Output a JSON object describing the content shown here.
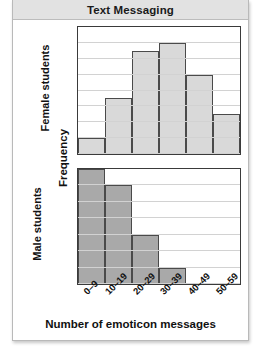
{
  "title": "Text Messaging",
  "axis": {
    "ylabel": "Frequency",
    "xlabel": "Number of emoticon messages"
  },
  "panels": {
    "female": {
      "label": "Female students",
      "yticks": [
        "0",
        "2",
        "4",
        "6",
        "8",
        "10",
        "12",
        "14",
        "16"
      ]
    },
    "male": {
      "label": "Male students",
      "yticks": [
        "0",
        "2",
        "4",
        "6",
        "8",
        "10",
        "12",
        "14"
      ]
    }
  },
  "colors": {
    "female_bar": "#d9d9d9",
    "male_bar": "#a9a9a9",
    "bar_outline": "#4a4a4a",
    "gridline": "#d2d2d2",
    "title_band": "#e2e2e2",
    "frame": "#b9b9b9"
  },
  "chart_data": {
    "type": "bar",
    "title": "Text Messaging",
    "xlabel": "Number of emoticon messages",
    "ylabel": "Frequency",
    "grid": true,
    "legend": "none",
    "categories": [
      "0–9",
      "10–19",
      "20–29",
      "30–39",
      "40–49",
      "50–59"
    ],
    "panels": [
      {
        "name": "Female students",
        "values": [
          2,
          7,
          13,
          14,
          10,
          5
        ],
        "ylim": [
          0,
          16
        ],
        "ytick_step": 2
      },
      {
        "name": "Male students",
        "values": [
          14,
          12,
          6,
          2,
          0,
          0
        ],
        "ylim": [
          0,
          14
        ],
        "ytick_step": 2
      }
    ]
  }
}
